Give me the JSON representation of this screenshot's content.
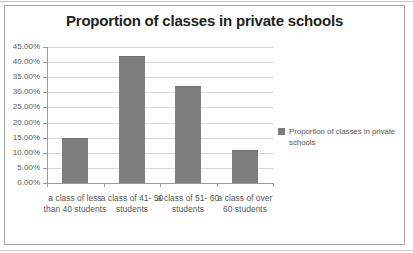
{
  "page": {
    "background": "#ffffff",
    "rule_color": "#c6c6c6"
  },
  "chart_data": {
    "type": "bar",
    "title": "Proportion of classes in private schools",
    "categories": [
      "a class of less than 40 students",
      "a class of 41- 50 students",
      "a class of 51- 60 students",
      "a class of over 60 students"
    ],
    "series": [
      {
        "name": "Proportion of classes in private schools",
        "values": [
          15,
          42,
          32,
          11
        ]
      }
    ],
    "value_unit": "percent",
    "ylim": [
      0,
      45
    ],
    "y_tick_step": 5,
    "y_tick_labels": [
      "0.00%",
      "5.00%",
      "10.00%",
      "15.00%",
      "20.00%",
      "25.00%",
      "30.00%",
      "35.00%",
      "40.00%",
      "45.00%"
    ],
    "xlabel": "",
    "ylabel": "",
    "grid": true,
    "legend_position": "right",
    "colors": {
      "bar_fill": "#7d7d7d",
      "bar_border": "#6e6e6e",
      "gridline": "#d9d9d9",
      "axis_line": "#9b9b9b",
      "tick_text": "#595959",
      "title_text": "#1f1f1f",
      "chart_border": "#a6a6a6",
      "legend_marker": "#7d7d7d"
    }
  }
}
